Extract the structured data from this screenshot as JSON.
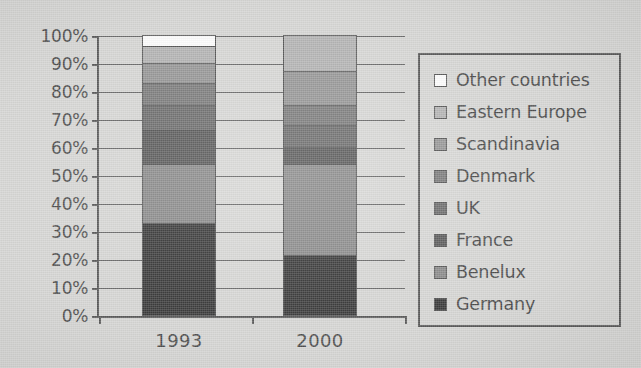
{
  "chart_data": {
    "type": "bar",
    "subtype": "stacked-100-percent",
    "title": "",
    "xlabel": "",
    "ylabel": "",
    "categories": [
      "1993",
      "2000"
    ],
    "ylim": [
      0,
      100
    ],
    "ytick_labels": [
      "0%",
      "10%",
      "20%",
      "30%",
      "40%",
      "50%",
      "60%",
      "70%",
      "80%",
      "90%",
      "100%"
    ],
    "ytick_values": [
      0,
      10,
      20,
      30,
      40,
      50,
      60,
      70,
      80,
      90,
      100
    ],
    "grid": true,
    "legend_position": "right",
    "stack_order_bottom_to_top": [
      "Germany",
      "Benelux",
      "France",
      "UK",
      "Denmark",
      "Scandinavia",
      "Eastern Europe",
      "Other countries"
    ],
    "series": [
      {
        "name": "Germany",
        "color": "#3b3b3b",
        "values": [
          33.0,
          21.5
        ]
      },
      {
        "name": "Benelux",
        "color": "#8c8c8c",
        "values": [
          21.0,
          32.5
        ]
      },
      {
        "name": "France",
        "color": "#5c5c5c",
        "values": [
          12.0,
          6.0
        ]
      },
      {
        "name": "UK",
        "color": "#6e6e6e",
        "values": [
          9.0,
          8.0
        ]
      },
      {
        "name": "Denmark",
        "color": "#7d7d7d",
        "values": [
          8.0,
          7.0
        ]
      },
      {
        "name": "Scandinavia",
        "color": "#989898",
        "values": [
          7.0,
          12.0
        ]
      },
      {
        "name": "Eastern Europe",
        "color": "#b5b5b5",
        "values": [
          6.0,
          13.0
        ]
      },
      {
        "name": "Other countries",
        "color": "#ffffff",
        "values": [
          4.0,
          0.0
        ]
      }
    ],
    "cumulative_tops": {
      "1993": [
        33.0,
        54.0,
        66.0,
        75.0,
        83.0,
        90.0,
        96.0,
        100.0
      ],
      "2000": [
        21.5,
        54.0,
        60.0,
        68.0,
        75.0,
        87.0,
        100.0,
        100.0
      ]
    }
  },
  "legend": {
    "items": [
      {
        "label": "Other countries",
        "color": "#ffffff"
      },
      {
        "label": "Eastern Europe",
        "color": "#b5b5b5"
      },
      {
        "label": "Scandinavia",
        "color": "#989898"
      },
      {
        "label": "Denmark",
        "color": "#7d7d7d"
      },
      {
        "label": "UK",
        "color": "#6e6e6e"
      },
      {
        "label": "France",
        "color": "#5c5c5c"
      },
      {
        "label": "Benelux",
        "color": "#8c8c8c"
      },
      {
        "label": "Germany",
        "color": "#3b3b3b"
      }
    ]
  },
  "axes": {
    "y_labels": [
      "100%",
      "90%",
      "80%",
      "70%",
      "60%",
      "50%",
      "40%",
      "30%",
      "20%",
      "10%",
      "0%"
    ],
    "x_labels": [
      "1993",
      "2000"
    ]
  },
  "colors": {
    "background": "#d9d9d7",
    "axis": "#5b5b5b",
    "grid": "#6d6d6d",
    "text": "#4f4f4f"
  }
}
